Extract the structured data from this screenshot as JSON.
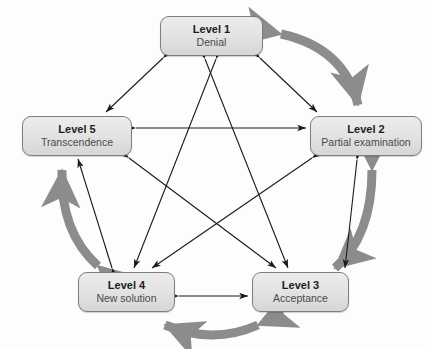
{
  "diagram": {
    "background_color": "#fdfdfd",
    "thick_arc_color": "#8c8c8c",
    "thin_arrow_color": "#1a1a1a",
    "node_border_color": "#7d7d7d",
    "node_fill_color": "#e4e4e4"
  },
  "nodes": [
    {
      "id": "n1",
      "title": "Level 1",
      "subtitle": "Denial"
    },
    {
      "id": "n2",
      "title": "Level 2",
      "subtitle": "Partial examination"
    },
    {
      "id": "n3",
      "title": "Level 3",
      "subtitle": "Acceptance"
    },
    {
      "id": "n4",
      "title": "Level 4",
      "subtitle": "New solution"
    },
    {
      "id": "n5",
      "title": "Level 5",
      "subtitle": "Transcendence"
    }
  ],
  "thick_arcs": [
    {
      "from": "Level 1",
      "to": "Level 2",
      "style": "double-headed"
    },
    {
      "from": "Level 2",
      "to": "Level 3",
      "style": "double-headed"
    },
    {
      "from": "Level 3",
      "to": "Level 4",
      "style": "double-headed"
    },
    {
      "from": "Level 4",
      "to": "Level 5",
      "style": "double-headed"
    }
  ],
  "thin_arrows": [
    {
      "from": "Level 1",
      "to": "Level 2",
      "style": "double-headed"
    },
    {
      "from": "Level 1",
      "to": "Level 3",
      "style": "double-headed"
    },
    {
      "from": "Level 1",
      "to": "Level 4",
      "style": "double-headed"
    },
    {
      "from": "Level 1",
      "to": "Level 5",
      "style": "double-headed"
    },
    {
      "from": "Level 2",
      "to": "Level 3",
      "style": "double-headed"
    },
    {
      "from": "Level 2",
      "to": "Level 4",
      "style": "double-headed"
    },
    {
      "from": "Level 2",
      "to": "Level 5",
      "style": "double-headed"
    },
    {
      "from": "Level 3",
      "to": "Level 5",
      "style": "double-headed"
    },
    {
      "from": "Level 3",
      "to": "Level 4",
      "style": "double-headed"
    },
    {
      "from": "Level 4",
      "to": "Level 5",
      "style": "double-headed"
    }
  ]
}
